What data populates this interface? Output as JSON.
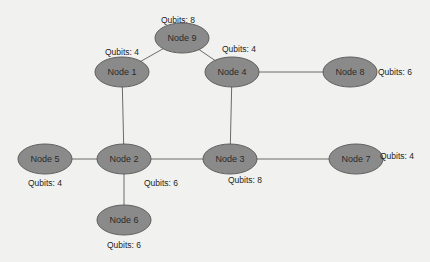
{
  "diagram": {
    "type": "network-graph",
    "colors": {
      "background": "#f1f1ef",
      "node_fill": "#8a8a8a",
      "node_stroke": "#5e5e5e",
      "edge": "#6a6a6a",
      "text": "#222222"
    },
    "nodes": [
      {
        "id": "9",
        "label": "Node 9",
        "qubits_label": "Qubits: 8",
        "qubits": 8,
        "cx": 182,
        "cy": 38,
        "qx": 178,
        "qy": 20,
        "anchor": "middle"
      },
      {
        "id": "1",
        "label": "Node 1",
        "qubits_label": "Qubits: 4",
        "qubits": 4,
        "cx": 122,
        "cy": 72,
        "qx": 122,
        "qy": 52,
        "anchor": "middle"
      },
      {
        "id": "4",
        "label": "Node 4",
        "qubits_label": "Qubits: 4",
        "qubits": 4,
        "cx": 232,
        "cy": 72,
        "qx": 222,
        "qy": 49,
        "anchor": "start"
      },
      {
        "id": "8",
        "label": "Node 8",
        "qubits_label": "Qubits: 6",
        "qubits": 6,
        "cx": 350,
        "cy": 72,
        "qx": 378,
        "qy": 72,
        "anchor": "start"
      },
      {
        "id": "5",
        "label": "Node 5",
        "qubits_label": "Qubits: 4",
        "qubits": 4,
        "cx": 45,
        "cy": 159,
        "qx": 45,
        "qy": 183,
        "anchor": "middle"
      },
      {
        "id": "2",
        "label": "Node 2",
        "qubits_label": "Qubits: 6",
        "qubits": 6,
        "cx": 124,
        "cy": 159,
        "qx": 144,
        "qy": 183,
        "anchor": "start"
      },
      {
        "id": "3",
        "label": "Node 3",
        "qubits_label": "Qubits: 8",
        "qubits": 8,
        "cx": 230,
        "cy": 159,
        "qx": 228,
        "qy": 180,
        "anchor": "start"
      },
      {
        "id": "7",
        "label": "Node 7",
        "qubits_label": "Qubits: 4",
        "qubits": 4,
        "cx": 356,
        "cy": 159,
        "qx": 380,
        "qy": 156,
        "anchor": "start"
      },
      {
        "id": "6",
        "label": "Node 6",
        "qubits_label": "Qubits: 6",
        "qubits": 6,
        "cx": 124,
        "cy": 220,
        "qx": 124,
        "qy": 245,
        "anchor": "middle"
      }
    ],
    "edges": [
      {
        "from": "9",
        "to": "1"
      },
      {
        "from": "9",
        "to": "4"
      },
      {
        "from": "4",
        "to": "8"
      },
      {
        "from": "4",
        "to": "3"
      },
      {
        "from": "1",
        "to": "2"
      },
      {
        "from": "5",
        "to": "2"
      },
      {
        "from": "2",
        "to": "3"
      },
      {
        "from": "3",
        "to": "7"
      },
      {
        "from": "2",
        "to": "6"
      }
    ]
  }
}
